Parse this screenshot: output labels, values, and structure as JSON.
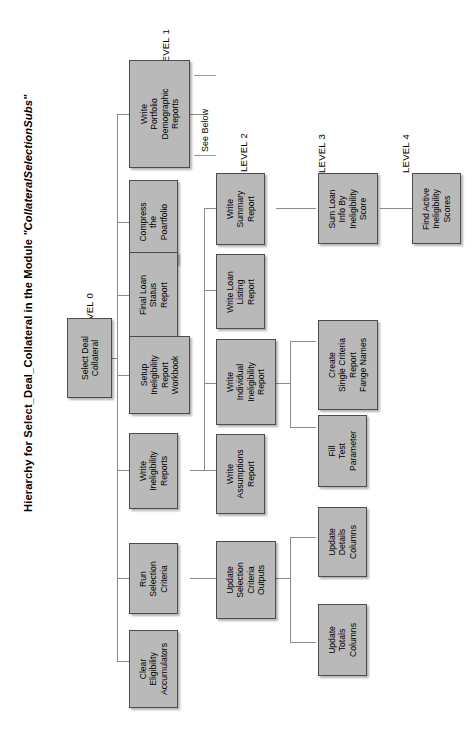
{
  "diagram": {
    "title_prefix": "Hierarchy for Select_Deal_Collateral in the Module ",
    "title_module": "\"CollateralSelectionSubs\"",
    "title_full": "Hierarchy for Select_Deal_Collateral in the Module \"CollateralSelectionSubs\"",
    "type": "hierarchy-tree",
    "orientation": "rotated-90-ccw",
    "box_fill": "#b9b9b9",
    "box_border": "#4c4c4c",
    "line_color": "#8c8c8c",
    "background": "#ffffff",
    "note": "See Below",
    "level_labels": [
      {
        "id": "level-0",
        "text": "LEVEL 0"
      },
      {
        "id": "level-1",
        "text": "LEVEL 1"
      },
      {
        "id": "level-2",
        "text": "LEVEL 2"
      },
      {
        "id": "level-3",
        "text": "LEVEL 3"
      },
      {
        "id": "level-4",
        "text": "LEVEL 4"
      }
    ],
    "nodes": [
      {
        "id": "select-deal-collateral",
        "level": 0,
        "label": "Select Deal\nCollateral"
      },
      {
        "id": "write-portfolio-demographic-reports",
        "level": 1,
        "label": "Write\nPortfolio\nDemographic\nReports"
      },
      {
        "id": "compress-the-poartfolio",
        "level": 1,
        "label": "Compress\nthe\nPoartfolio"
      },
      {
        "id": "final-loan-status-report",
        "level": 1,
        "label": "Final Loan\nStatus\nReport"
      },
      {
        "id": "setup-ineligibility-report-workbook",
        "level": 1,
        "label": "Setup\nIneligibility\nReport\nWorkbook"
      },
      {
        "id": "write-ineligibility-reports",
        "level": 1,
        "label": "Write\nIneligibility\nReports"
      },
      {
        "id": "run-selection-criteria",
        "level": 1,
        "label": "Run\nSelection\nCriteria"
      },
      {
        "id": "clear-eligibility-accumulators",
        "level": 1,
        "label": "Clear\nEligibility\nAccumulators"
      },
      {
        "id": "write-summary-report",
        "level": 2,
        "label": "Write\nSummary\nReport"
      },
      {
        "id": "write-loan-listing-report",
        "level": 2,
        "label": "Write Loan\nListing\nReport"
      },
      {
        "id": "write-individual-ineligibility-report",
        "level": 2,
        "label": "Write\nIndividual\nIneligibility\nReport"
      },
      {
        "id": "write-assumptions-report",
        "level": 2,
        "label": "Write\nAssumptions\nReport"
      },
      {
        "id": "update-selection-criteria-outputs",
        "level": 2,
        "label": "Update\nSelection\nCriteria\nOutputs"
      },
      {
        "id": "sum-loan-info-by-ineligibility-score",
        "level": 3,
        "label": "Sum Loan\nInfo By\nIneligibility\nScore"
      },
      {
        "id": "create-single-criteria-report-fange-names",
        "level": 3,
        "label": "Create\nSingle Criteria\nReport\nFange Names"
      },
      {
        "id": "fill-test-parameter",
        "level": 3,
        "label": "Fill\nTest\nParameter"
      },
      {
        "id": "update-details-columns",
        "level": 3,
        "label": "Update\nDetails\nColumns"
      },
      {
        "id": "update-totals-columns",
        "level": 3,
        "label": "Update\nTotals\nColumns"
      },
      {
        "id": "find-active-ineligibility-scores",
        "level": 4,
        "label": "Find Active\nIneligibility\nScores"
      }
    ],
    "edges": [
      {
        "from": "select-deal-collateral",
        "to": "write-portfolio-demographic-reports"
      },
      {
        "from": "select-deal-collateral",
        "to": "compress-the-poartfolio"
      },
      {
        "from": "select-deal-collateral",
        "to": "final-loan-status-report"
      },
      {
        "from": "select-deal-collateral",
        "to": "setup-ineligibility-report-workbook"
      },
      {
        "from": "select-deal-collateral",
        "to": "write-ineligibility-reports"
      },
      {
        "from": "select-deal-collateral",
        "to": "run-selection-criteria"
      },
      {
        "from": "select-deal-collateral",
        "to": "clear-eligibility-accumulators"
      },
      {
        "from": "write-ineligibility-reports",
        "to": "write-summary-report"
      },
      {
        "from": "write-ineligibility-reports",
        "to": "write-loan-listing-report"
      },
      {
        "from": "write-ineligibility-reports",
        "to": "write-individual-ineligibility-report"
      },
      {
        "from": "write-ineligibility-reports",
        "to": "write-assumptions-report"
      },
      {
        "from": "run-selection-criteria",
        "to": "update-selection-criteria-outputs"
      },
      {
        "from": "write-summary-report",
        "to": "sum-loan-info-by-ineligibility-score"
      },
      {
        "from": "write-individual-ineligibility-report",
        "to": "create-single-criteria-report-fange-names"
      },
      {
        "from": "write-individual-ineligibility-report",
        "to": "fill-test-parameter"
      },
      {
        "from": "update-selection-criteria-outputs",
        "to": "update-details-columns"
      },
      {
        "from": "update-selection-criteria-outputs",
        "to": "update-totals-columns"
      },
      {
        "from": "sum-loan-info-by-ineligibility-score",
        "to": "find-active-ineligibility-scores"
      }
    ]
  }
}
